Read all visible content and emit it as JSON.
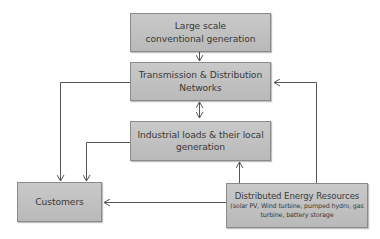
{
  "diagram": {
    "nodes": {
      "conventional": {
        "label": "Large scale conventional generation"
      },
      "transmission": {
        "label": "Transmission & Distribution Networks"
      },
      "industrial": {
        "label": "Industrial loads & their local generation"
      },
      "customers": {
        "label": "Customers"
      },
      "der": {
        "label": "Distributed Energy Resources",
        "sublabel": "(solar PV, Wind turbine, pumped hydro, gas turbine, battery storage"
      }
    },
    "edges": [
      {
        "from": "Large scale conventional generation",
        "to": "Transmission & Distribution Networks",
        "direction": "one-way"
      },
      {
        "from": "Transmission & Distribution Networks",
        "to": "Industrial loads & their local generation",
        "direction": "two-way"
      },
      {
        "from": "Transmission & Distribution Networks",
        "to": "Customers",
        "direction": "one-way"
      },
      {
        "from": "Industrial loads & their local generation",
        "to": "Customers",
        "direction": "one-way"
      },
      {
        "from": "Distributed Energy Resources",
        "to": "Industrial loads & their local generation",
        "direction": "one-way"
      },
      {
        "from": "Distributed Energy Resources",
        "to": "Customers",
        "direction": "one-way"
      },
      {
        "from": "Distributed Energy Resources",
        "to": "Transmission & Distribution Networks",
        "direction": "one-way"
      }
    ],
    "colors": {
      "box_fill": "#c0c0c0",
      "box_border": "#8a8a8a",
      "line": "#555555",
      "text": "#3a3a3a"
    }
  }
}
